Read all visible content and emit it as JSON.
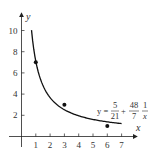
{
  "chart_data": {
    "type": "scatter",
    "title": "",
    "xlabel": "x",
    "ylabel": "y",
    "xlim": [
      0,
      7.5
    ],
    "ylim": [
      0,
      11
    ],
    "x_ticks": [
      1,
      2,
      3,
      4,
      5,
      6,
      7
    ],
    "y_ticks": [
      2,
      4,
      6,
      8,
      10
    ],
    "grid": false,
    "points": [
      {
        "x": 1,
        "y": 7
      },
      {
        "x": 3,
        "y": 3
      },
      {
        "x": 6,
        "y": 1
      }
    ],
    "fit_curve": {
      "formula": "y = 5/21 + (48/7)(1/x)",
      "a": 0.238095,
      "b": 6.857143,
      "x_range": [
        0.7,
        7
      ]
    },
    "annotation": {
      "lhs": "y =",
      "frac1_num": "5",
      "frac1_den": "21",
      "plus": "+",
      "frac2_num": "48",
      "frac2_den": "7",
      "frac3_num": "1",
      "frac3_den": "x"
    }
  }
}
